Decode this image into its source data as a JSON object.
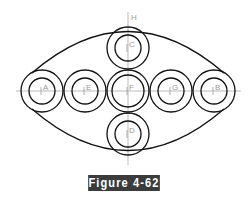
{
  "figure": {
    "caption": "Figure 4-62",
    "caption_bg": "#3b3b3b",
    "caption_color": "#ffffff"
  },
  "diagram": {
    "outline": {
      "type": "lens",
      "left_x": 28,
      "right_x": 228,
      "top_y": 26,
      "bottom_y": 155
    },
    "axis_label": "H",
    "circles": [
      {
        "label": "A",
        "cx": 42,
        "cy": 91,
        "r_outer": 21,
        "r_inner": 13
      },
      {
        "label": "E",
        "cx": 85,
        "cy": 91,
        "r_outer": 21,
        "r_inner": 13
      },
      {
        "label": "F",
        "cx": 128,
        "cy": 91,
        "r_outer": 21,
        "r_inner": 16
      },
      {
        "label": "G",
        "cx": 171,
        "cy": 91,
        "r_outer": 21,
        "r_inner": 13
      },
      {
        "label": "B",
        "cx": 214,
        "cy": 91,
        "r_outer": 21,
        "r_inner": 13
      },
      {
        "label": "C",
        "cx": 128,
        "cy": 48,
        "r_outer": 21,
        "r_inner": 13
      },
      {
        "label": "D",
        "cx": 128,
        "cy": 134,
        "r_outer": 21,
        "r_inner": 13
      }
    ]
  }
}
